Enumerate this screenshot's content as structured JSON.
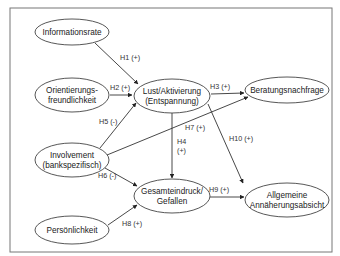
{
  "colors": {
    "stroke": "#444444",
    "text": "#222222",
    "frame": "#777777",
    "background": "#ffffff"
  },
  "nodes": [
    {
      "id": "informationsrate",
      "lines": [
        "Informationsrate"
      ],
      "cx": 72,
      "cy": 32,
      "rx": 37,
      "ry": 13
    },
    {
      "id": "orientierung",
      "lines": [
        "Orientierungs-",
        "freundlichkeit"
      ],
      "cx": 72,
      "cy": 95,
      "rx": 37,
      "ry": 17
    },
    {
      "id": "involvement",
      "lines": [
        "Involvement",
        "(bankspezifisch)"
      ],
      "cx": 72,
      "cy": 160,
      "rx": 37,
      "ry": 17
    },
    {
      "id": "persoenlichkeit",
      "lines": [
        "Persönlichkeit"
      ],
      "cx": 72,
      "cy": 230,
      "rx": 37,
      "ry": 14
    },
    {
      "id": "lust",
      "lines": [
        "Lust/Aktivierung",
        "(Entspannung)"
      ],
      "cx": 172,
      "cy": 96,
      "rx": 38,
      "ry": 17
    },
    {
      "id": "beratung",
      "lines": [
        "Beratungsnachfrage"
      ],
      "cx": 287,
      "cy": 90,
      "rx": 42,
      "ry": 13
    },
    {
      "id": "gesamteindruck",
      "lines": [
        "Gesamteindruck/",
        "Gefallen"
      ],
      "cx": 172,
      "cy": 196,
      "rx": 38,
      "ry": 17
    },
    {
      "id": "annaeherung",
      "lines": [
        "Allgemeine",
        "Annäherungsabsicht"
      ],
      "cx": 287,
      "cy": 200,
      "rx": 42,
      "ry": 17
    }
  ],
  "edges": [
    {
      "id": "H1",
      "label": "H1 (+)",
      "x1": 95,
      "y1": 43,
      "x2": 138,
      "y2": 84,
      "lx": 120,
      "ly": 60,
      "lines": [
        "H1 (+)"
      ]
    },
    {
      "id": "H2",
      "label": "H2 (+)",
      "x1": 110,
      "y1": 95,
      "x2": 132,
      "y2": 95,
      "lx": 110,
      "ly": 90,
      "lines": [
        "H2 (+)"
      ]
    },
    {
      "id": "H3",
      "label": "H3 (+)",
      "x1": 211,
      "y1": 94,
      "x2": 244,
      "y2": 93,
      "lx": 210,
      "ly": 89,
      "lines": [
        "H3 (+)"
      ]
    },
    {
      "id": "H4",
      "label": "H4 (+)",
      "x1": 172,
      "y1": 113,
      "x2": 172,
      "y2": 178,
      "lx": 177,
      "ly": 144,
      "lines": [
        "H4",
        "(+)"
      ]
    },
    {
      "id": "H5",
      "label": "H5 (-)",
      "x1": 100,
      "y1": 148,
      "x2": 136,
      "y2": 103,
      "lx": 99,
      "ly": 124,
      "lines": [
        "H5 (-)"
      ]
    },
    {
      "id": "H6",
      "label": "H6 (-)",
      "x1": 105,
      "y1": 168,
      "x2": 137,
      "y2": 186,
      "lx": 98,
      "ly": 178,
      "lines": [
        "H6 (-)"
      ]
    },
    {
      "id": "H7",
      "label": "H7 (+)",
      "x1": 107,
      "y1": 155,
      "x2": 248,
      "y2": 97,
      "lx": 185,
      "ly": 130,
      "lines": [
        "H7 (+)"
      ]
    },
    {
      "id": "H8",
      "label": "H8 (+)",
      "x1": 108,
      "y1": 225,
      "x2": 137,
      "y2": 205,
      "lx": 122,
      "ly": 226,
      "lines": [
        "H8 (+)"
      ]
    },
    {
      "id": "H9",
      "label": "H9 (+)",
      "x1": 210,
      "y1": 197,
      "x2": 244,
      "y2": 197,
      "lx": 209,
      "ly": 192,
      "lines": [
        "H9 (+)"
      ]
    },
    {
      "id": "H10",
      "label": "H10 (+)",
      "x1": 208,
      "y1": 104,
      "x2": 243,
      "y2": 183,
      "lx": 229,
      "ly": 141,
      "lines": [
        "H10 (+)"
      ]
    }
  ],
  "frame": {
    "x": 10,
    "y": 8,
    "width": 322,
    "height": 244
  }
}
